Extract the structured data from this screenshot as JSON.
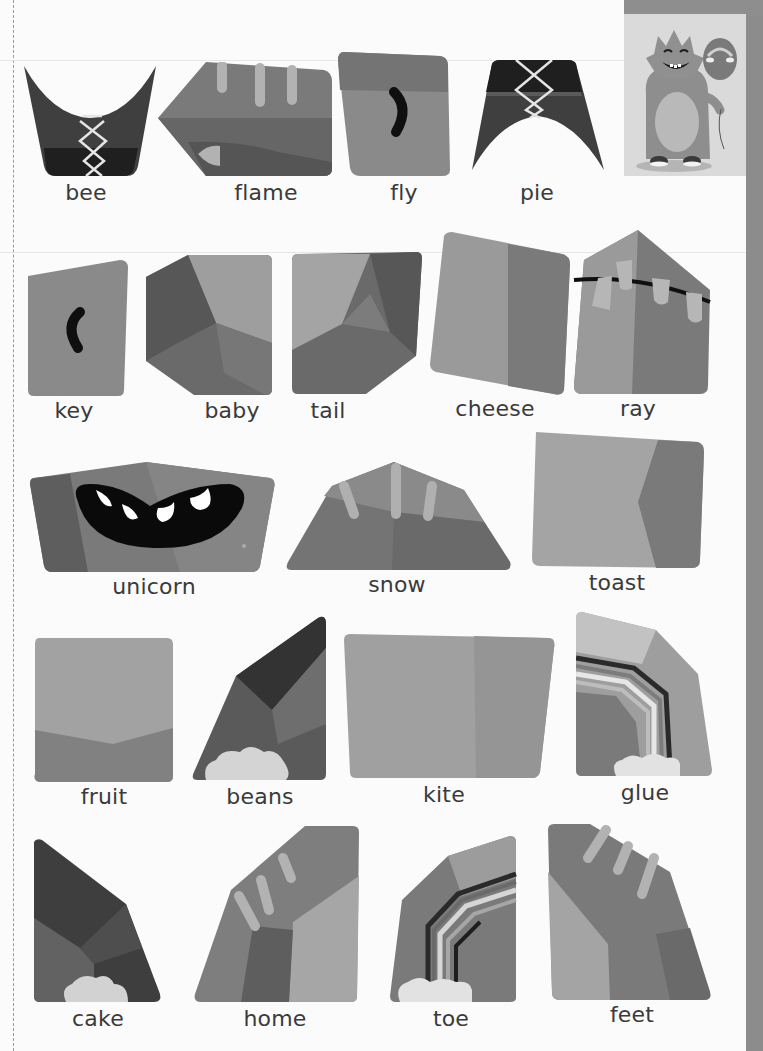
{
  "page": {
    "type": "printed puzzle-piece word activity sheet",
    "color_mode": "grayscale"
  },
  "character_card": {
    "description": "smiling monster holding a balloon"
  },
  "rows": [
    {
      "words": [
        "bee",
        "flame",
        "fly",
        "pie"
      ]
    },
    {
      "words": [
        "key",
        "baby",
        "tail",
        "cheese",
        "ray"
      ]
    },
    {
      "words": [
        "unicorn",
        "snow",
        "toast"
      ]
    },
    {
      "words": [
        "fruit",
        "beans",
        "kite",
        "glue"
      ]
    },
    {
      "words": [
        "cake",
        "home",
        "toe",
        "feet"
      ]
    }
  ],
  "pieces": [
    {
      "word": "bee",
      "feature": "lace-crisscross"
    },
    {
      "word": "flame",
      "feature": "stripes"
    },
    {
      "word": "fly",
      "feature": "eye-curve"
    },
    {
      "word": "pie",
      "feature": "lace-crisscross"
    },
    {
      "word": "key",
      "feature": "eye-curve"
    },
    {
      "word": "baby",
      "feature": "faceted"
    },
    {
      "word": "tail",
      "feature": "faceted"
    },
    {
      "word": "cheese",
      "feature": "two-tone"
    },
    {
      "word": "ray",
      "feature": "bunting"
    },
    {
      "word": "unicorn",
      "feature": "mouth-teeth"
    },
    {
      "word": "snow",
      "feature": "stripes"
    },
    {
      "word": "toast",
      "feature": "two-tone"
    },
    {
      "word": "fruit",
      "feature": "two-tone"
    },
    {
      "word": "beans",
      "feature": "cloud"
    },
    {
      "word": "kite",
      "feature": "plain"
    },
    {
      "word": "glue",
      "feature": "rainbow-cloud"
    },
    {
      "word": "cake",
      "feature": "cloud"
    },
    {
      "word": "home",
      "feature": "stripes"
    },
    {
      "word": "toe",
      "feature": "rainbow-cloud"
    },
    {
      "word": "feet",
      "feature": "stripes"
    }
  ],
  "colors": {
    "page_bg": "#fbfbfb",
    "text": "#3a3a3a",
    "piece_light": "#a8a8a8",
    "piece_mid": "#8a8a8a",
    "piece_dark": "#6e6e6e",
    "piece_darkest": "#2e2e2e",
    "strip": "#8c8c8c"
  }
}
